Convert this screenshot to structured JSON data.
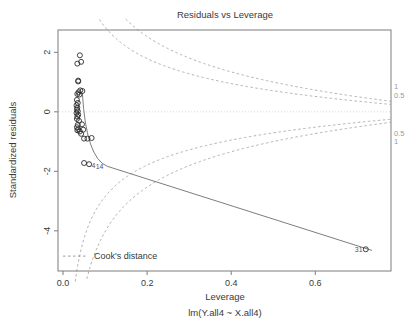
{
  "chart_data": {
    "type": "scatter",
    "title": "Residuals vs Leverage",
    "xlabel": "Leverage",
    "sublabel": "lm(Y.all4 ~ X.all4)",
    "ylabel": "Standardized residuals",
    "xlim": [
      -0.012,
      0.78
    ],
    "ylim": [
      -5.35,
      2.75
    ],
    "xticks": [
      "0.0",
      "0.2",
      "0.4",
      "0.6"
    ],
    "xtickvals": [
      0.0,
      0.2,
      0.4,
      0.6
    ],
    "yticks": [
      "2",
      "0",
      "-2",
      "-4"
    ],
    "ytickvals": [
      2,
      0,
      -2,
      -4
    ],
    "grid": false,
    "legend": "Cook's distance",
    "legend_position": "bottom-left",
    "reference_line_y": 0,
    "points": [
      {
        "x": 0.04,
        "y": 1.9
      },
      {
        "x": 0.034,
        "y": 1.62
      },
      {
        "x": 0.043,
        "y": 1.68
      },
      {
        "x": 0.036,
        "y": 1.05
      },
      {
        "x": 0.036,
        "y": 1.02
      },
      {
        "x": 0.041,
        "y": 0.72
      },
      {
        "x": 0.046,
        "y": 0.7
      },
      {
        "x": 0.037,
        "y": 0.66
      },
      {
        "x": 0.034,
        "y": 0.6
      },
      {
        "x": 0.039,
        "y": 0.58
      },
      {
        "x": 0.033,
        "y": 0.4
      },
      {
        "x": 0.035,
        "y": 0.3
      },
      {
        "x": 0.032,
        "y": 0.22
      },
      {
        "x": 0.034,
        "y": 0.14
      },
      {
        "x": 0.033,
        "y": 0.08
      },
      {
        "x": 0.035,
        "y": 0.02
      },
      {
        "x": 0.032,
        "y": -0.04
      },
      {
        "x": 0.036,
        "y": -0.1
      },
      {
        "x": 0.034,
        "y": -0.16
      },
      {
        "x": 0.033,
        "y": -0.24
      },
      {
        "x": 0.038,
        "y": -0.3
      },
      {
        "x": 0.035,
        "y": -0.44
      },
      {
        "x": 0.045,
        "y": -0.42
      },
      {
        "x": 0.033,
        "y": -0.52
      },
      {
        "x": 0.036,
        "y": -0.58
      },
      {
        "x": 0.034,
        "y": -0.62
      },
      {
        "x": 0.04,
        "y": -0.66
      },
      {
        "x": 0.048,
        "y": -0.6
      },
      {
        "x": 0.043,
        "y": -0.74
      },
      {
        "x": 0.05,
        "y": -0.9
      },
      {
        "x": 0.058,
        "y": -0.9
      },
      {
        "x": 0.068,
        "y": -0.88
      },
      {
        "x": 0.05,
        "y": -1.72
      },
      {
        "x": 0.062,
        "y": -1.76
      },
      {
        "x": 0.72,
        "y": -4.62
      }
    ],
    "labeled_points": [
      {
        "label": "31",
        "x": 0.72,
        "y": -4.62
      },
      {
        "label": "4",
        "x": 0.062,
        "y": -1.76
      },
      {
        "label": "14",
        "x": 0.068,
        "y": -1.78
      }
    ],
    "cook_contours": [
      {
        "level": "1",
        "label": "1",
        "side": "upper",
        "label_y": 0.86
      },
      {
        "level": "0.5",
        "label": "0.5",
        "side": "upper",
        "label_y": 0.55
      },
      {
        "level": "0.5",
        "label": "0.5",
        "side": "lower",
        "label_y": -0.7
      },
      {
        "level": "1",
        "label": "1",
        "side": "lower",
        "label_y": -0.98
      }
    ],
    "trend_line": {
      "description": "smoothed residual trend",
      "from": {
        "x": 0.046,
        "y": 0.62
      },
      "to": {
        "x": 0.735,
        "y": -4.66
      }
    }
  }
}
